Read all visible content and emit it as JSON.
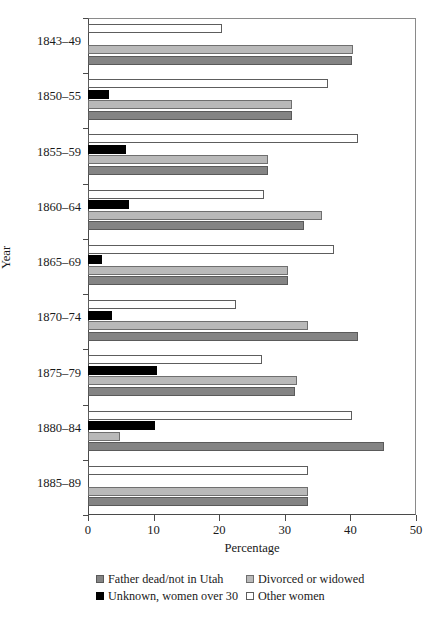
{
  "chart_data": {
    "type": "bar",
    "orientation": "horizontal",
    "title": "",
    "xlabel": "Percentage",
    "ylabel": "Year",
    "xlim": [
      0,
      50
    ],
    "xticks": [
      0,
      10,
      20,
      30,
      40,
      50
    ],
    "xtick_labels": [
      "0",
      "10",
      "20",
      "30",
      "40",
      "50"
    ],
    "grid": false,
    "legend_position": "bottom",
    "categories": [
      "1843–49",
      "1850–55",
      "1855–59",
      "1860–64",
      "1865–69",
      "1870–74",
      "1875–79",
      "1880–84",
      "1885–89"
    ],
    "series": [
      {
        "name": "Father dead/not in Utah",
        "key": "father",
        "color": "#848484",
        "values": [
          40.2,
          31.1,
          27.4,
          33.0,
          30.5,
          41.2,
          31.6,
          45.1,
          33.5
        ]
      },
      {
        "name": "Divorced or widowed",
        "key": "divorced",
        "color": "#b9b9b9",
        "values": [
          40.4,
          31.1,
          27.4,
          35.7,
          30.5,
          33.5,
          31.9,
          4.9,
          33.5
        ]
      },
      {
        "name": "Unknown, women over 30",
        "key": "unknown",
        "color": "#000000",
        "values": [
          0,
          3.2,
          5.8,
          6.2,
          2.1,
          3.7,
          10.5,
          10.2,
          0
        ]
      },
      {
        "name": "Other women",
        "key": "other",
        "color": "#ffffff",
        "values": [
          20.4,
          36.6,
          41.2,
          26.8,
          37.5,
          22.5,
          26.5,
          40.2,
          33.5
        ]
      }
    ]
  },
  "axes": {
    "x_title": "Percentage",
    "y_title": "Year"
  },
  "legend": {
    "entries": [
      {
        "label": "Father dead/not in Utah",
        "key": "father"
      },
      {
        "label": "Divorced or widowed",
        "key": "divorced"
      },
      {
        "label": "Unknown, women over 30",
        "key": "unknown"
      },
      {
        "label": "Other women",
        "key": "other"
      }
    ]
  }
}
